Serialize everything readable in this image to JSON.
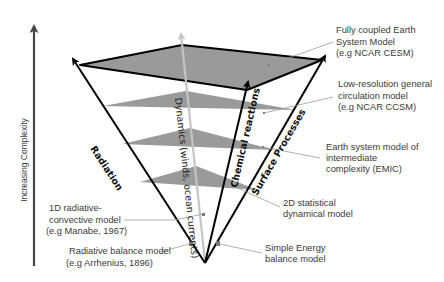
{
  "axis": {
    "label": "Increasing Complexity"
  },
  "arrows": {
    "radiation": "Radiation",
    "dynamics": "Dynamics (winds, ocean currents)",
    "chemical": "Chemical reactions",
    "surface": "Surface Processes"
  },
  "models": [
    {
      "id": "fully-coupled",
      "lines": [
        "Fully coupled Earth",
        "System Model",
        "(e.g NCAR CESM)"
      ]
    },
    {
      "id": "low-res-gcm",
      "lines": [
        "Low-resolution general",
        "circulation model",
        "(e.g NCAR CCSM)"
      ]
    },
    {
      "id": "emic",
      "lines": [
        "Earth system model of",
        "intermediate",
        "complexity (EMIC)"
      ]
    },
    {
      "id": "2d-sd",
      "lines": [
        "2D statistical",
        "dynamical model"
      ]
    },
    {
      "id": "seb",
      "lines": [
        "Simple Energy",
        "balance model"
      ]
    },
    {
      "id": "1d-rc",
      "lines": [
        "1D radiative-",
        "convective model",
        "(e.g Manabe, 1967)"
      ]
    },
    {
      "id": "rad-balance",
      "lines": [
        "Radiative balance model",
        "(e.g Arrhenius, 1896)"
      ]
    }
  ],
  "colors": {
    "plane": "#9a9a9a",
    "outline": "#000000",
    "dynamics_arrow": "#c4c4c4",
    "axis": "#444444",
    "leader": "#9a9a9a",
    "text": "#3a3a3a"
  }
}
